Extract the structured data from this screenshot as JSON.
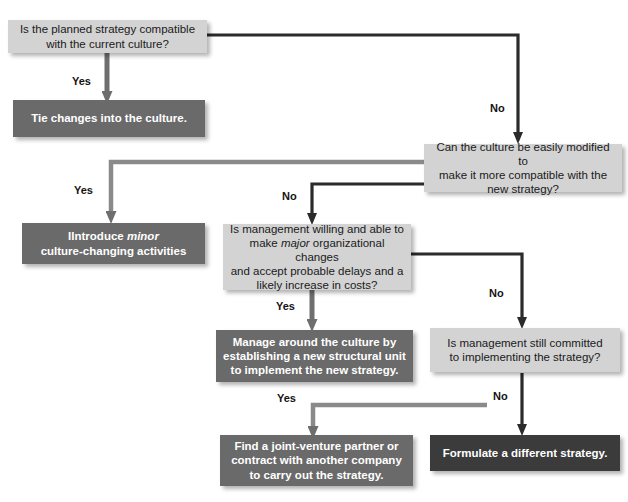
{
  "diagram": {
    "colors": {
      "decision_box": "#d3d3d3",
      "action_box": "#6a6a6a",
      "action_box_dark": "#3b3b3b",
      "connector": "#333333",
      "connector_light": "#8a8a8a",
      "text_on_light": "#1a1a1a",
      "text_on_dark": "#ffffff",
      "background": "#ffffff"
    },
    "nodes": [
      {
        "id": "q1",
        "type": "decision",
        "text_lines": [
          "Is the planned strategy compatible",
          "with the current culture?"
        ],
        "text": "Is the planned strategy compatible with the current culture?"
      },
      {
        "id": "a1",
        "type": "action",
        "text_lines": [
          "Tie changes into the culture."
        ],
        "text": "Tie changes into the culture."
      },
      {
        "id": "q2",
        "type": "decision",
        "text_lines": [
          "Can the culture be easily modified to",
          "make it more compatible with the",
          "new strategy?"
        ],
        "text": "Can the culture be easily modified to make it more compatible with the new strategy?"
      },
      {
        "id": "a2",
        "type": "action",
        "text_lines": [
          "Introduce minor",
          "culture-changing activities"
        ],
        "text": "Introduce minor culture-changing activities",
        "italic_word": "minor"
      },
      {
        "id": "q3",
        "type": "decision",
        "text_lines": [
          "Is management willing and able to",
          "make major organizational changes",
          "and accept probable delays and a",
          "likely increase in costs?"
        ],
        "text": "Is management willing and able to make major organizational changes and accept probable delays and a likely increase in costs?",
        "italic_word": "major"
      },
      {
        "id": "a3",
        "type": "action",
        "text_lines": [
          "Manage around the culture by",
          "establishing a new structural unit",
          "to implement the new strategy."
        ],
        "text": "Manage around the culture by establishing a new structural unit to implement the new strategy."
      },
      {
        "id": "q4",
        "type": "decision",
        "text_lines": [
          "Is management still committed",
          "to implementing the strategy?"
        ],
        "text": "Is management still committed to implementing the strategy?"
      },
      {
        "id": "a4",
        "type": "action",
        "text_lines": [
          "Find a joint-venture partner or",
          "contract with another company",
          "to carry out the strategy."
        ],
        "text": "Find a joint-venture partner or contract with another company to carry out the strategy."
      },
      {
        "id": "a5",
        "type": "action-dark",
        "text_lines": [
          "Formulate a different strategy."
        ],
        "text": "Formulate a different strategy."
      }
    ],
    "edge_labels": {
      "q1_yes": "Yes",
      "q1_no": "No",
      "q2_yes": "Yes",
      "q2_no": "No",
      "q3_yes": "Yes",
      "q3_no": "No",
      "q4_yes": "Yes",
      "q4_no": "No"
    }
  }
}
